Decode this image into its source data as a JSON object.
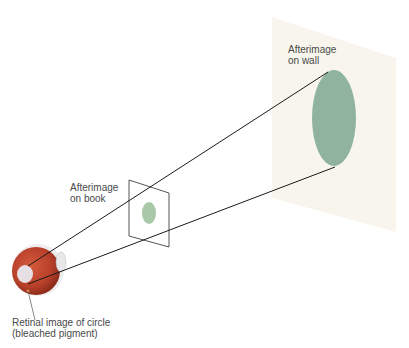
{
  "labels": {
    "wall_line1": "Afterimage",
    "wall_line2": "on wall",
    "book_line1": "Afterimage",
    "book_line2": "on book",
    "retina_line1": "Retinal image of circle",
    "retina_line2": "(bleached pigment)"
  },
  "colors": {
    "wall": "#f8f6ec",
    "afterimage": "#8fb39f",
    "eye": "#c4472c",
    "line": "#1a1a1a"
  }
}
